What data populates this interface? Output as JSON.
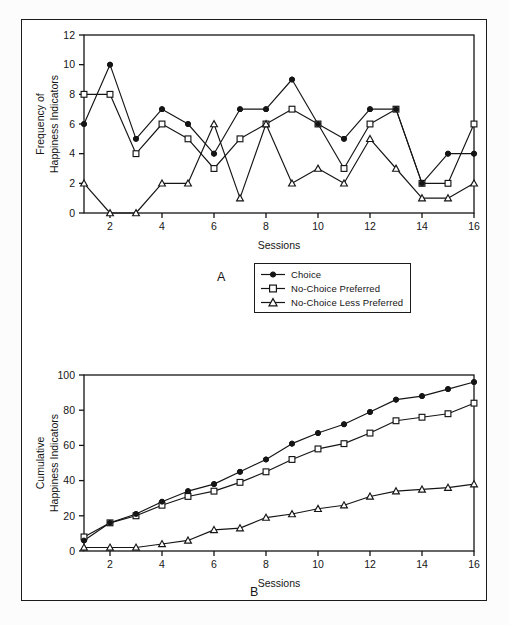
{
  "figure": {
    "background_color": "#ffffff",
    "frame_color": "#1b1b1b",
    "line_color": "#151515"
  },
  "legend": {
    "position": "below-panel-a-right",
    "items": [
      {
        "label": "Choice",
        "marker": "filled-circle"
      },
      {
        "label": "No-Choice Preferred",
        "marker": "open-square"
      },
      {
        "label": "No-Choice Less Preferred",
        "marker": "open-triangle"
      }
    ]
  },
  "panel_a": {
    "letter": "A",
    "xlabel": "Sessions",
    "ylabel_line1": "Frequency of",
    "ylabel_line2": "Happiness Indicators",
    "yticks": [
      0,
      2,
      4,
      6,
      8,
      10,
      12
    ],
    "xticks": [
      2,
      4,
      6,
      8,
      10,
      12,
      14,
      16
    ]
  },
  "panel_b": {
    "letter": "B",
    "xlabel": "Sessions",
    "ylabel_line1": "Cumulative",
    "ylabel_line2": "Happiness Indicators",
    "yticks": [
      0,
      20,
      40,
      60,
      80,
      100
    ],
    "xticks": [
      2,
      4,
      6,
      8,
      10,
      12,
      14,
      16
    ]
  },
  "chart_data": [
    {
      "type": "line",
      "panel": "A",
      "title": "",
      "xlabel": "Sessions",
      "ylabel": "Frequency of Happiness Indicators",
      "x": [
        1,
        2,
        3,
        4,
        5,
        6,
        7,
        8,
        9,
        10,
        11,
        12,
        13,
        14,
        15,
        16
      ],
      "xlim": [
        1,
        16
      ],
      "ylim": [
        0,
        12
      ],
      "xtick_labels": [
        "2",
        "4",
        "6",
        "8",
        "10",
        "12",
        "14",
        "16"
      ],
      "ytick_labels": [
        "0",
        "2",
        "4",
        "6",
        "8",
        "10",
        "12"
      ],
      "grid": false,
      "legend_position": "outside-below-right",
      "series": [
        {
          "name": "Choice",
          "marker": "filled-circle",
          "values": [
            6,
            10,
            5,
            7,
            6,
            4,
            7,
            7,
            9,
            6,
            5,
            7,
            7,
            2,
            4,
            4
          ]
        },
        {
          "name": "No-Choice Preferred",
          "marker": "open-square",
          "values": [
            8,
            8,
            4,
            6,
            5,
            3,
            5,
            6,
            7,
            6,
            3,
            6,
            7,
            2,
            2,
            6
          ]
        },
        {
          "name": "No-Choice Less Preferred",
          "marker": "open-triangle",
          "values": [
            2,
            0,
            0,
            2,
            2,
            6,
            1,
            6,
            2,
            3,
            2,
            5,
            3,
            1,
            1,
            2
          ]
        }
      ]
    },
    {
      "type": "line",
      "panel": "B",
      "title": "",
      "xlabel": "Sessions",
      "ylabel": "Cumulative Happiness Indicators",
      "x": [
        1,
        2,
        3,
        4,
        5,
        6,
        7,
        8,
        9,
        10,
        11,
        12,
        13,
        14,
        15,
        16
      ],
      "xlim": [
        1,
        16
      ],
      "ylim": [
        0,
        100
      ],
      "xtick_labels": [
        "2",
        "4",
        "6",
        "8",
        "10",
        "12",
        "14",
        "16"
      ],
      "ytick_labels": [
        "0",
        "20",
        "40",
        "60",
        "80",
        "100"
      ],
      "grid": false,
      "legend_position": "none",
      "series": [
        {
          "name": "Choice",
          "marker": "filled-circle",
          "values": [
            6,
            16,
            21,
            28,
            34,
            38,
            45,
            52,
            61,
            67,
            72,
            79,
            86,
            88,
            92,
            96
          ]
        },
        {
          "name": "No-Choice Preferred",
          "marker": "open-square",
          "values": [
            8,
            16,
            20,
            26,
            31,
            34,
            39,
            45,
            52,
            58,
            61,
            67,
            74,
            76,
            78,
            84
          ]
        },
        {
          "name": "No-Choice Less Preferred",
          "marker": "open-triangle",
          "values": [
            2,
            2,
            2,
            4,
            6,
            12,
            13,
            19,
            21,
            24,
            26,
            31,
            34,
            35,
            36,
            38
          ]
        }
      ]
    }
  ]
}
